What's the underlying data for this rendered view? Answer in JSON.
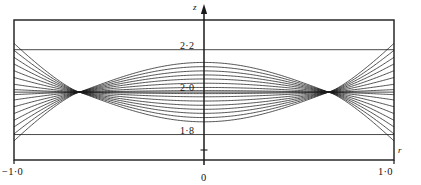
{
  "figure": {
    "kind": "line-plot",
    "background": "#ffffff",
    "ink": "#1a1a1a",
    "frame": {
      "left": 14,
      "top": 20,
      "right": 394,
      "bottom": 160
    }
  },
  "axes": {
    "vertical_axis_name": "z",
    "horizontal_axis_name": "r",
    "origin_label": "0"
  },
  "chart_data": {
    "type": "line",
    "title": "",
    "xlabel": "r",
    "ylabel": "z",
    "xlim": [
      -1.0,
      1.0
    ],
    "ylim": [
      1.68,
      2.34
    ],
    "grid": true,
    "grid_axis": "y",
    "legend": null,
    "xticks": [
      -1.0,
      0.0,
      1.0
    ],
    "xticklabels": [
      "−1·0",
      "0",
      "1·0"
    ],
    "yticks": [
      1.8,
      2.0,
      2.2
    ],
    "yticklabels": [
      "1·8",
      "2·0",
      "2·2"
    ],
    "baseline": 2.0,
    "nodes_x": [
      -0.655,
      0.655
    ],
    "series": [
      {
        "name": "a=+1.00",
        "amplitude": 0.14,
        "edge": 0.23
      },
      {
        "name": "a=+0.86",
        "amplitude": 0.12,
        "edge": 0.197
      },
      {
        "name": "a=+0.72",
        "amplitude": 0.1,
        "edge": 0.164
      },
      {
        "name": "a=+0.58",
        "amplitude": 0.081,
        "edge": 0.133
      },
      {
        "name": "a=+0.44",
        "amplitude": 0.062,
        "edge": 0.101
      },
      {
        "name": "a=+0.30",
        "amplitude": 0.042,
        "edge": 0.069
      },
      {
        "name": "a=+0.16",
        "amplitude": 0.022,
        "edge": 0.037
      },
      {
        "name": "a=+0.05",
        "amplitude": 0.007,
        "edge": 0.012
      },
      {
        "name": "a=-0.05",
        "amplitude": -0.007,
        "edge": -0.012
      },
      {
        "name": "a=-0.16",
        "amplitude": -0.022,
        "edge": -0.037
      },
      {
        "name": "a=-0.30",
        "amplitude": -0.042,
        "edge": -0.069
      },
      {
        "name": "a=-0.44",
        "amplitude": -0.062,
        "edge": -0.101
      },
      {
        "name": "a=-0.58",
        "amplitude": -0.081,
        "edge": -0.133
      },
      {
        "name": "a=-0.72",
        "amplitude": -0.1,
        "edge": -0.164
      },
      {
        "name": "a=-0.86",
        "amplitude": -0.12,
        "edge": -0.197
      },
      {
        "name": "a=-1.00",
        "amplitude": -0.14,
        "edge": -0.23
      }
    ]
  }
}
